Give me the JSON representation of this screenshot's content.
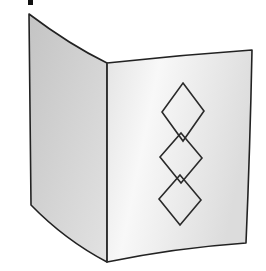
{
  "illustration": {
    "subject": "folded greeting card",
    "description": "Standing folded card with three stacked outlined diamonds on front panel",
    "colors": {
      "background": "#ffffff",
      "left_panel": "#cfcfcf",
      "right_panel": "#e6e6e6",
      "highlight": "#f7f7f7",
      "outline": "#222222"
    },
    "left_panel": {
      "points": [
        [
          29,
          14
        ],
        [
          107,
          63
        ],
        [
          107,
          262
        ],
        [
          31,
          205
        ]
      ]
    },
    "right_panel": {
      "points": [
        [
          107,
          63
        ],
        [
          252,
          50
        ],
        [
          245,
          243
        ],
        [
          107,
          262
        ]
      ]
    },
    "mark": {
      "x": 28,
      "y": 0,
      "w": 5,
      "h": 5
    },
    "diamonds": [
      {
        "cx": 183,
        "top": 83,
        "bottom": 141,
        "half_width": 21
      },
      {
        "cx": 181,
        "top": 133,
        "bottom": 183,
        "half_width": 21
      },
      {
        "cx": 180,
        "top": 175,
        "bottom": 225,
        "half_width": 21
      }
    ]
  }
}
